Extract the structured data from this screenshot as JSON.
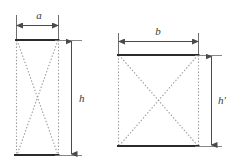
{
  "figure": {
    "background_color": "#ffffff",
    "solid_line_color": "#2b2b2b",
    "dotted_line_color": "#9a9a9a",
    "dimension_line_color": "#4a4a4a",
    "label_color": "#3a3a3a",
    "shapes": [
      {
        "id": "left-shape",
        "name": "tall-narrow-rectangle",
        "width_label": "a",
        "height_label": "h",
        "width_dimension_orientation": "horizontal-top",
        "height_dimension_orientation": "vertical-right",
        "outline_style": "dotted",
        "top_edge_style": "solid",
        "bottom_edge_style": "solid",
        "diagonals": "X-cross-dotted"
      },
      {
        "id": "right-shape",
        "name": "wide-short-rectangle",
        "width_label": "b",
        "height_label": "h'",
        "width_dimension_orientation": "horizontal-top",
        "height_dimension_orientation": "vertical-right",
        "outline_style": "dotted",
        "top_edge_style": "solid",
        "bottom_edge_style": "solid",
        "diagonals": "X-cross-dotted"
      }
    ],
    "labels": {
      "left_width": "a",
      "left_height": "h",
      "right_width": "b",
      "right_height": "h'"
    }
  }
}
